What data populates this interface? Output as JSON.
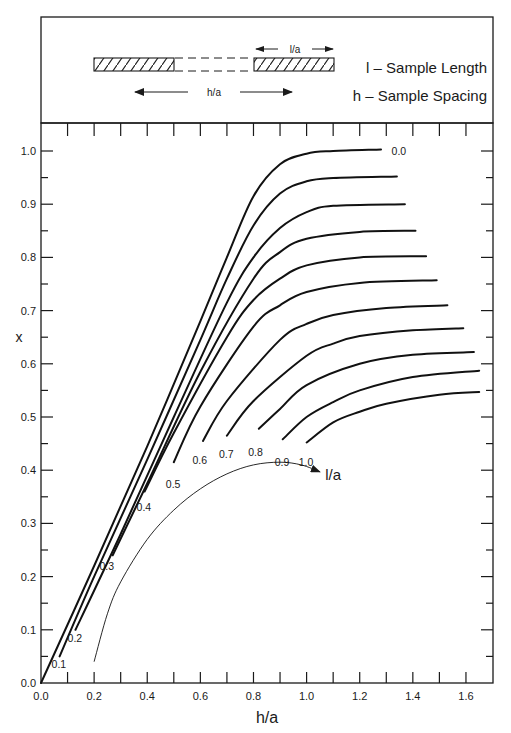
{
  "legend_panel": {
    "segment_label": "l/a",
    "spacing_label": "h/a",
    "line1": "l – Sample Length",
    "line2": "h – Sample Spacing"
  },
  "chart_data": {
    "type": "line",
    "title": "",
    "xlabel": "h/a",
    "ylabel": "x",
    "xlim": [
      0.0,
      1.7
    ],
    "ylim": [
      0.0,
      1.05
    ],
    "x_ticks_major": [
      0.0,
      0.2,
      0.4,
      0.6,
      0.8,
      1.0,
      1.2,
      1.4,
      1.6
    ],
    "x_tick_labels": [
      "0.0",
      "0.2",
      "0.4",
      "0.6",
      "0.8",
      "1.0",
      "1.2",
      "1.4",
      "1.6"
    ],
    "x_ticks_minor_step": 0.1,
    "y_ticks_major": [
      0.0,
      0.1,
      0.2,
      0.3,
      0.4,
      0.5,
      0.6,
      0.7,
      0.8,
      0.9,
      1.0
    ],
    "y_tick_labels": [
      "0.0",
      "0.1",
      "0.2",
      "0.3",
      "0.4",
      "0.5",
      "0.6",
      "0.7",
      "0.8",
      "0.9",
      "1.0"
    ],
    "y_ticks_minor_step": 0.05,
    "grid": false,
    "legend_position": "top panel (schematic)",
    "series": [
      {
        "name": "0.0",
        "label_pos": [
          1.32,
          1.0
        ],
        "points": [
          [
            0,
            0
          ],
          [
            0.2,
            0.22
          ],
          [
            0.4,
            0.445
          ],
          [
            0.6,
            0.68
          ],
          [
            0.7,
            0.8
          ],
          [
            0.8,
            0.915
          ],
          [
            0.9,
            0.975
          ],
          [
            1.0,
            0.995
          ],
          [
            1.1,
            1.0
          ],
          [
            1.28,
            1.003
          ]
        ]
      },
      {
        "name": "0.1",
        "label_pos": [
          0.04,
          0.035
        ],
        "points": [
          [
            0.07,
            0.05
          ],
          [
            0.2,
            0.2
          ],
          [
            0.4,
            0.42
          ],
          [
            0.6,
            0.645
          ],
          [
            0.7,
            0.76
          ],
          [
            0.8,
            0.86
          ],
          [
            0.9,
            0.92
          ],
          [
            1.0,
            0.943
          ],
          [
            1.1,
            0.949
          ],
          [
            1.34,
            0.952
          ]
        ]
      },
      {
        "name": "0.2",
        "label_pos": [
          0.1,
          0.085
        ],
        "points": [
          [
            0.13,
            0.1
          ],
          [
            0.3,
            0.28
          ],
          [
            0.5,
            0.5
          ],
          [
            0.7,
            0.715
          ],
          [
            0.8,
            0.8
          ],
          [
            0.9,
            0.855
          ],
          [
            1.0,
            0.885
          ],
          [
            1.1,
            0.897
          ],
          [
            1.37,
            0.9
          ]
        ]
      },
      {
        "name": "0.3",
        "label_pos": [
          0.22,
          0.22
        ],
        "points": [
          [
            0.27,
            0.24
          ],
          [
            0.4,
            0.375
          ],
          [
            0.6,
            0.585
          ],
          [
            0.8,
            0.76
          ],
          [
            0.9,
            0.81
          ],
          [
            1.0,
            0.835
          ],
          [
            1.2,
            0.848
          ],
          [
            1.41,
            0.85
          ]
        ]
      },
      {
        "name": "0.4",
        "label_pos": [
          0.36,
          0.33
        ],
        "points": [
          [
            0.39,
            0.36
          ],
          [
            0.5,
            0.47
          ],
          [
            0.7,
            0.65
          ],
          [
            0.8,
            0.72
          ],
          [
            0.9,
            0.76
          ],
          [
            1.0,
            0.785
          ],
          [
            1.2,
            0.8
          ],
          [
            1.45,
            0.802
          ]
        ]
      },
      {
        "name": "0.5",
        "label_pos": [
          0.47,
          0.375
        ],
        "points": [
          [
            0.5,
            0.415
          ],
          [
            0.6,
            0.52
          ],
          [
            0.8,
            0.67
          ],
          [
            0.9,
            0.71
          ],
          [
            1.0,
            0.735
          ],
          [
            1.2,
            0.752
          ],
          [
            1.49,
            0.757
          ]
        ]
      },
      {
        "name": "0.6",
        "label_pos": [
          0.57,
          0.42
        ],
        "points": [
          [
            0.61,
            0.455
          ],
          [
            0.7,
            0.53
          ],
          [
            0.9,
            0.645
          ],
          [
            1.0,
            0.675
          ],
          [
            1.1,
            0.692
          ],
          [
            1.3,
            0.705
          ],
          [
            1.53,
            0.71
          ]
        ]
      },
      {
        "name": "0.7",
        "label_pos": [
          0.67,
          0.43
        ],
        "points": [
          [
            0.7,
            0.465
          ],
          [
            0.8,
            0.53
          ],
          [
            1.0,
            0.615
          ],
          [
            1.1,
            0.638
          ],
          [
            1.2,
            0.652
          ],
          [
            1.4,
            0.663
          ],
          [
            1.59,
            0.667
          ]
        ]
      },
      {
        "name": "0.8",
        "label_pos": [
          0.78,
          0.435
        ],
        "points": [
          [
            0.82,
            0.478
          ],
          [
            0.9,
            0.515
          ],
          [
            1.0,
            0.56
          ],
          [
            1.2,
            0.6
          ],
          [
            1.4,
            0.617
          ],
          [
            1.63,
            0.622
          ]
        ]
      },
      {
        "name": "0.9",
        "label_pos": [
          0.88,
          0.415
        ],
        "points": [
          [
            0.91,
            0.458
          ],
          [
            1.0,
            0.5
          ],
          [
            1.1,
            0.528
          ],
          [
            1.2,
            0.55
          ],
          [
            1.4,
            0.575
          ],
          [
            1.65,
            0.587
          ]
        ]
      },
      {
        "name": "1.0",
        "label_pos": [
          0.97,
          0.415
        ],
        "points": [
          [
            1.0,
            0.452
          ],
          [
            1.1,
            0.49
          ],
          [
            1.2,
            0.51
          ],
          [
            1.3,
            0.525
          ],
          [
            1.5,
            0.542
          ],
          [
            1.65,
            0.547
          ]
        ]
      }
    ],
    "annotations": [
      {
        "text": "l/a",
        "type": "arrow-curve",
        "label_pos": [
          1.07,
          0.385
        ],
        "points": [
          [
            0.2,
            0.04
          ],
          [
            0.25,
            0.13
          ],
          [
            0.3,
            0.19
          ],
          [
            0.4,
            0.27
          ],
          [
            0.5,
            0.325
          ],
          [
            0.6,
            0.365
          ],
          [
            0.7,
            0.393
          ],
          [
            0.8,
            0.41
          ],
          [
            0.9,
            0.415
          ],
          [
            0.98,
            0.41
          ],
          [
            1.05,
            0.397
          ]
        ]
      }
    ],
    "series_legend_title": "l/a"
  }
}
